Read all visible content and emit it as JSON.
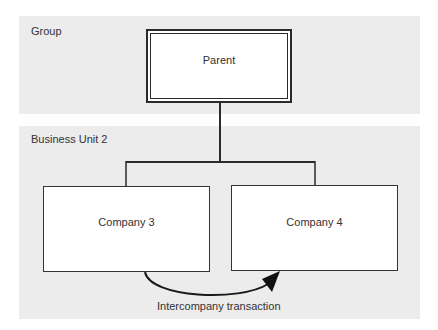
{
  "groups": [
    {
      "label": "Group"
    },
    {
      "label": "Business Unit 2"
    }
  ],
  "nodes": {
    "parent": {
      "label": "Parent",
      "style": "double-border"
    },
    "company3": {
      "label": "Company 3"
    },
    "company4": {
      "label": "Company 4"
    }
  },
  "edges": [
    {
      "from": "parent",
      "to": "company3",
      "type": "hierarchy"
    },
    {
      "from": "parent",
      "to": "company4",
      "type": "hierarchy"
    },
    {
      "from": "company3",
      "to": "company4",
      "type": "curved-arrow",
      "label": "Intercompany transaction"
    }
  ],
  "colors": {
    "band_fill": "#ececec",
    "line": "#2a2a2a",
    "box_fill": "#ffffff"
  }
}
